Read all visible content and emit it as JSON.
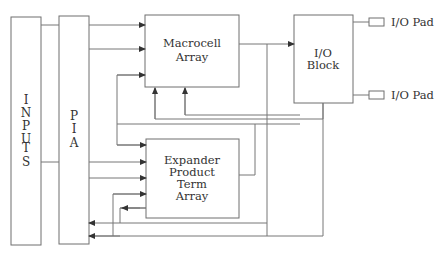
{
  "diagram": {
    "type": "block-diagram",
    "blocks": {
      "inputs": {
        "label_letters": [
          "I",
          "N",
          "P",
          "U",
          "T",
          "S"
        ]
      },
      "pia": {
        "label_letters": [
          "P",
          "I",
          "A"
        ]
      },
      "macrocell": {
        "line1": "Macrocell",
        "line2": "Array"
      },
      "expander": {
        "line1": "Expander",
        "line2": "Product",
        "line3": "Term",
        "line4": "Array"
      },
      "io_block": {
        "line1": "I/O",
        "line2": "Block"
      },
      "io_pad_top": {
        "label": "I/O Pad"
      },
      "io_pad_bottom": {
        "label": "I/O Pad"
      }
    },
    "connections": [
      "INPUTS -> PIA",
      "PIA -> Macrocell Array (2)",
      "PIA -> Expander Product Term Array (2)",
      "Expander Product Term Array -> Macrocell Array",
      "Macrocell Array -> I/O Block",
      "Macrocell Array -> Expander Product Term Array",
      "Macrocell Array -> PIA",
      "I/O Block -> Macrocell Array",
      "I/O Block -> PIA",
      "I/O Block -> I/O Pad (2)"
    ]
  }
}
